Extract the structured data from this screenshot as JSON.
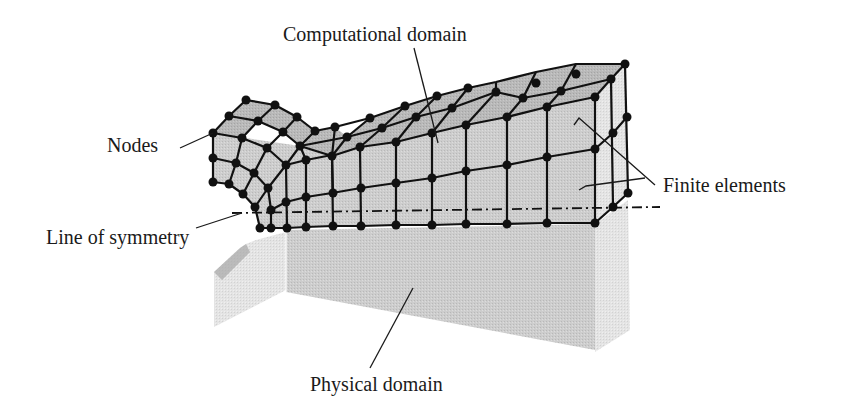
{
  "figure": {
    "labels": {
      "computational_domain": "Computational domain",
      "nodes": "Nodes",
      "finite_elements": "Finite elements",
      "line_of_symmetry": "Line of symmetry",
      "physical_domain": "Physical domain"
    },
    "colors": {
      "background": "#ffffff",
      "mesh_line": "#111111",
      "node": "#111111",
      "front_face": "#c9c9c9",
      "top_face": "#b3b3b3",
      "side_face": "#e2e2e2",
      "physical_front": "#cfcfcf",
      "physical_side": "#e6e6e6",
      "text": "#1a1a1a"
    }
  }
}
